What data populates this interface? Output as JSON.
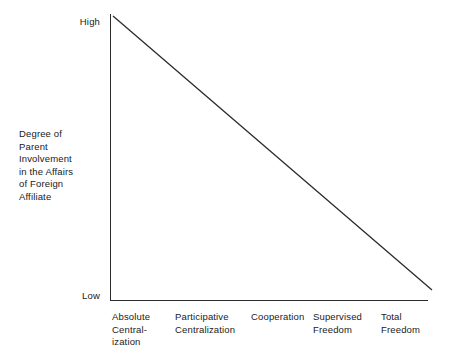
{
  "chart_data": {
    "type": "line",
    "title": "",
    "subtitle": "",
    "xlabel": "",
    "ylabel": "Degree of Parent Involvement in the Affairs of Foreign Affiliate",
    "categories": [
      "Absolute Centralization",
      "Participative Centralization",
      "Cooperation",
      "Supervised Freedom",
      "Total Freedom"
    ],
    "x": [
      0,
      1,
      2,
      3,
      4
    ],
    "values": [
      1.0,
      0.75,
      0.5,
      0.25,
      0.0
    ],
    "ytick_labels": [
      "Low",
      "High"
    ],
    "ylim": [
      0,
      1
    ],
    "xlim": [
      0,
      4
    ],
    "grid": false,
    "legend": false,
    "series": [
      {
        "name": "Degree of Parent Involvement",
        "values": [
          1.0,
          0.75,
          0.5,
          0.25,
          0.0
        ],
        "color": "#2b2b2b"
      }
    ],
    "annotations": [],
    "axis_color": "#2b2b2b",
    "line_color": "#2b2b2b",
    "background": "#ffffff"
  },
  "axes": {
    "y_title_lines": [
      "Degree of",
      "Parent",
      "Involvement",
      "in the Affairs",
      "of Foreign",
      "Affiliate"
    ],
    "y_tick_high": "High",
    "y_tick_low": "Low",
    "x_categories": [
      {
        "lines": [
          "Absolute",
          "Central-",
          "ization"
        ]
      },
      {
        "lines": [
          "Participative",
          "Centralization"
        ]
      },
      {
        "lines": [
          "Cooperation"
        ]
      },
      {
        "lines": [
          "Supervised",
          "Freedom"
        ]
      },
      {
        "lines": [
          "Total",
          "Freedom"
        ]
      }
    ]
  }
}
